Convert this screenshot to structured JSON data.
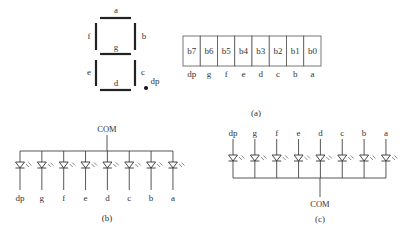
{
  "seven_segment": {
    "labels": {
      "a": "a",
      "b": "b",
      "c": "c",
      "d": "d",
      "e": "e",
      "f": "f",
      "g": "g",
      "dp": "dp"
    }
  },
  "bit_table": {
    "bits": [
      "b7",
      "b6",
      "b5",
      "b4",
      "b3",
      "b2",
      "b1",
      "b0"
    ],
    "segments": [
      "dp",
      "g",
      "f",
      "e",
      "d",
      "c",
      "b",
      "a"
    ]
  },
  "caption_a": "(a)",
  "common_anode": {
    "com_label": "COM",
    "segments": [
      "dp",
      "g",
      "f",
      "e",
      "d",
      "c",
      "b",
      "a"
    ],
    "caption": "(b)"
  },
  "common_cathode": {
    "com_label": "COM",
    "segments": [
      "dp",
      "g",
      "f",
      "e",
      "d",
      "c",
      "b",
      "a"
    ],
    "caption": "(c)"
  }
}
